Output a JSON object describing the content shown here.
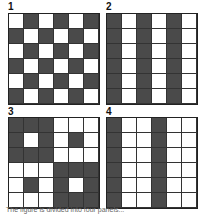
{
  "panels": [
    {
      "label": "1",
      "grid": [
        [
          0,
          1,
          0,
          1,
          0,
          1
        ],
        [
          1,
          0,
          1,
          0,
          1,
          0
        ],
        [
          0,
          1,
          0,
          1,
          0,
          1
        ],
        [
          1,
          0,
          1,
          0,
          1,
          0
        ],
        [
          0,
          1,
          0,
          1,
          0,
          1
        ],
        [
          1,
          0,
          1,
          0,
          1,
          0
        ]
      ]
    },
    {
      "label": "2",
      "grid": [
        [
          1,
          0,
          1,
          0,
          1,
          0
        ],
        [
          1,
          0,
          1,
          0,
          1,
          0
        ],
        [
          1,
          0,
          1,
          0,
          1,
          0
        ],
        [
          1,
          0,
          1,
          0,
          1,
          0
        ],
        [
          1,
          0,
          1,
          0,
          1,
          0
        ],
        [
          1,
          0,
          1,
          0,
          1,
          0
        ]
      ]
    },
    {
      "label": "3",
      "grid": [
        [
          1,
          1,
          1,
          0,
          0,
          0
        ],
        [
          1,
          0,
          1,
          0,
          1,
          0
        ],
        [
          1,
          1,
          1,
          0,
          0,
          0
        ],
        [
          0,
          0,
          0,
          1,
          1,
          1
        ],
        [
          0,
          1,
          0,
          1,
          0,
          1
        ],
        [
          0,
          0,
          0,
          1,
          1,
          1
        ]
      ]
    },
    {
      "label": "4",
      "grid": [
        [
          1,
          0,
          0,
          1,
          0,
          0
        ],
        [
          1,
          0,
          0,
          1,
          0,
          0
        ],
        [
          1,
          0,
          0,
          1,
          0,
          0
        ],
        [
          1,
          0,
          0,
          1,
          0,
          0
        ],
        [
          1,
          0,
          0,
          1,
          0,
          0
        ],
        [
          1,
          0,
          0,
          1,
          0,
          0
        ]
      ]
    }
  ],
  "colors": {
    "dark": "#4a4a4a",
    "light": "#ffffff",
    "line": "#333333"
  },
  "caption": "The figure is divided into four panels..."
}
